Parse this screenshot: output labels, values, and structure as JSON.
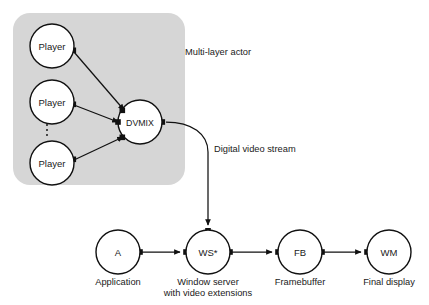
{
  "diagram": {
    "background_color": "#ffffff",
    "group_fill_color": "#d6d6d6",
    "stroke_color": "#111111",
    "node_fill_color": "#ffffff",
    "annotations": {
      "group_label": "Multi-layer actor",
      "stream_label": "Digital video stream"
    },
    "ellipsis": "⋮",
    "group_nodes": [
      {
        "id": "player1",
        "label": "Player",
        "cx": 52,
        "cy": 46,
        "r": 22
      },
      {
        "id": "player2",
        "label": "Player",
        "cx": 52,
        "cy": 102,
        "r": 22
      },
      {
        "id": "player3",
        "label": "Player",
        "cx": 52,
        "cy": 163,
        "r": 22
      },
      {
        "id": "dvmix",
        "label": "DVMIX",
        "cx": 140,
        "cy": 122,
        "r": 22
      }
    ],
    "pipeline_nodes": [
      {
        "id": "a",
        "label": "A",
        "caption": [
          "Application"
        ],
        "cx": 118,
        "cy": 252,
        "r": 22
      },
      {
        "id": "ws",
        "label": "WS*",
        "caption": [
          "Window server",
          "with video extensions"
        ],
        "cx": 208,
        "cy": 252,
        "r": 22
      },
      {
        "id": "fb",
        "label": "FB",
        "caption": [
          "Framebuffer"
        ],
        "cx": 300,
        "cy": 252,
        "r": 22
      },
      {
        "id": "wm",
        "label": "WM",
        "caption": [
          "Final display"
        ],
        "cx": 389,
        "cy": 252,
        "r": 22
      }
    ],
    "edges": [
      {
        "id": "player1-to-dvmix",
        "from": "player1",
        "to": "dvmix"
      },
      {
        "id": "player2-to-dvmix",
        "from": "player2",
        "to": "dvmix"
      },
      {
        "id": "player3-to-dvmix",
        "from": "player3",
        "to": "dvmix"
      },
      {
        "id": "dvmix-to-ws",
        "from": "dvmix",
        "to": "ws",
        "label": "Digital video stream"
      },
      {
        "id": "a-to-ws",
        "from": "a",
        "to": "ws"
      },
      {
        "id": "ws-to-fb",
        "from": "ws",
        "to": "fb"
      },
      {
        "id": "fb-to-wm",
        "from": "fb",
        "to": "wm"
      }
    ]
  }
}
